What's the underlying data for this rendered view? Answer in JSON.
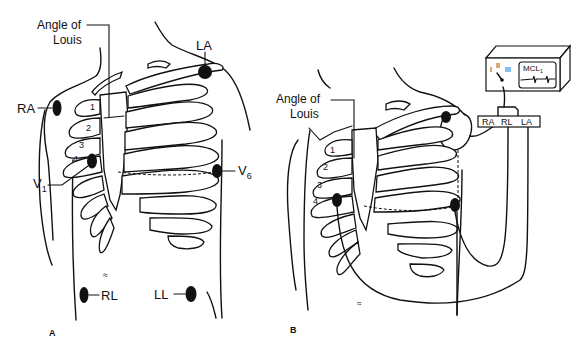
{
  "figure": {
    "panels": [
      {
        "id": "A",
        "label": "A",
        "annotation": "Angle of\nLouis",
        "annotation_lines": [
          "Angle of",
          "Louis"
        ],
        "electrodes": [
          {
            "name": "RA",
            "label": "RA"
          },
          {
            "name": "LA",
            "label": "LA"
          },
          {
            "name": "V1",
            "label": "V",
            "subscript": "1"
          },
          {
            "name": "V6",
            "label": "V",
            "subscript": "6"
          },
          {
            "name": "RL",
            "label": "RL"
          },
          {
            "name": "LL",
            "label": "LL"
          }
        ],
        "rib_numbers": [
          "1",
          "2",
          "3",
          "4"
        ]
      },
      {
        "id": "B",
        "label": "B",
        "annotation_lines": [
          "Angle of",
          "Louis"
        ],
        "rib_numbers": [
          "1",
          "2",
          "3",
          "4"
        ],
        "monitor": {
          "lead_selector": [
            "I",
            "II",
            "III"
          ],
          "screen_label": "MCL",
          "screen_subscript": "1"
        },
        "cable_block": [
          "RA",
          "RL",
          "LA"
        ]
      }
    ]
  }
}
